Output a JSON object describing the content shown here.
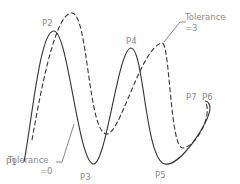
{
  "diagram": {
    "points": [
      {
        "id": "P1",
        "label": "P1"
      },
      {
        "id": "P2",
        "label": "P2"
      },
      {
        "id": "P3",
        "label": "P3"
      },
      {
        "id": "P4",
        "label": "P4"
      },
      {
        "id": "P5",
        "label": "P5"
      },
      {
        "id": "P6",
        "label": "P6"
      },
      {
        "id": "P7",
        "label": "P7"
      }
    ],
    "annotations": {
      "tolerance_3": {
        "line1": "Tolerance",
        "line2": "=3"
      },
      "tolerance_0": {
        "line1": "Tolerance",
        "line2": "=0"
      }
    },
    "curves": [
      {
        "name": "spline-tolerance-0",
        "style": "solid"
      },
      {
        "name": "spline-tolerance-3",
        "style": "dashed"
      }
    ],
    "colors": {
      "stroke": "#333333",
      "label": "#8a8a8a",
      "background": "#ffffff"
    }
  }
}
